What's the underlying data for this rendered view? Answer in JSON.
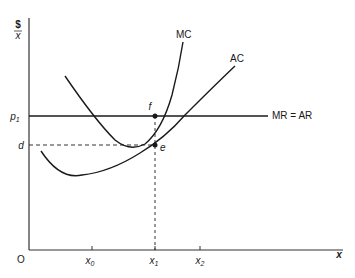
{
  "diagram": {
    "y_axis": {
      "label_top": "$",
      "label_bottom": "x"
    },
    "x_axis": {
      "label": "x",
      "origin": "O",
      "ticks": [
        {
          "base": "x",
          "sub": "0"
        },
        {
          "base": "x",
          "sub": "1"
        },
        {
          "base": "x",
          "sub": "2"
        }
      ]
    },
    "y_ticks": {
      "p1": {
        "base": "p",
        "sub": "1"
      },
      "d": "d"
    },
    "curves": {
      "mc": "MC",
      "ac": "AC",
      "mr": "MR = AR"
    },
    "points": {
      "f": "f",
      "e": "e"
    },
    "colors": {
      "line": "#1a1a1a",
      "background": "#ffffff"
    }
  }
}
